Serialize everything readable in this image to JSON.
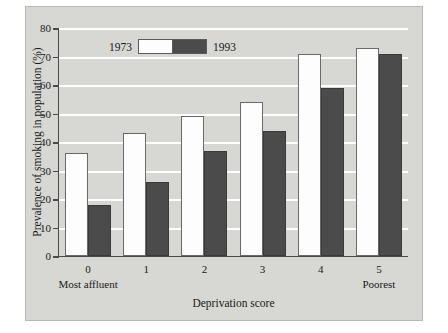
{
  "chart_data": {
    "type": "bar",
    "title": "",
    "subtitle": "",
    "xlabel": "Deprivation score",
    "ylabel": "Prevalence of smoking in population (%)",
    "categories": [
      "0",
      "1",
      "2",
      "3",
      "4",
      "5"
    ],
    "category_annotations": {
      "first": "Most affluent",
      "last": "Poorest"
    },
    "series": [
      {
        "name": "1973",
        "values": [
          36,
          43,
          49,
          54,
          71,
          73
        ],
        "color": "#fdfdfd"
      },
      {
        "name": "1993",
        "values": [
          18,
          26,
          37,
          44,
          59,
          71
        ],
        "color": "#4b4b4b"
      }
    ],
    "ylim": [
      0,
      80
    ],
    "ytick_labels": [
      "0",
      "10",
      "20",
      "30",
      "40",
      "50",
      "60",
      "70",
      "80"
    ],
    "ytick_values": [
      0,
      10,
      20,
      30,
      40,
      50,
      60,
      70,
      80
    ],
    "grid": "horizontal-white",
    "legend_position": "top-left-inside",
    "background_color": "#d7d7d4"
  }
}
